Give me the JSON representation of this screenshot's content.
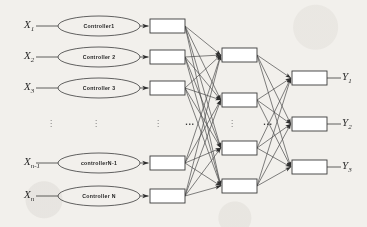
{
  "diagram": {
    "stroke_color": "#3b3b3b",
    "background_color": "#f2f0ec",
    "ellipsis_vertical": "vertical-ellipsis",
    "ellipsis_horizontal": "...",
    "inputs": [
      {
        "label": "X",
        "sub": "1",
        "controller": "Controller1",
        "y": 26
      },
      {
        "label": "X",
        "sub": "2",
        "controller": "Controller 2",
        "y": 57
      },
      {
        "label": "X",
        "sub": "3",
        "controller": "Controller 3",
        "y": 88
      },
      {
        "label": "X",
        "sub": "n-1",
        "controller": "controllerN-1",
        "y": 163
      },
      {
        "label": "X",
        "sub": "n",
        "controller": "Controller N",
        "y": 196
      }
    ],
    "input_boxes_y": [
      26,
      57,
      88,
      163,
      196
    ],
    "hidden_boxes_y": [
      55,
      100,
      148,
      186
    ],
    "output_boxes_y": [
      78,
      124,
      167
    ],
    "outputs": [
      {
        "label": "Y",
        "sub": "1",
        "y": 78
      },
      {
        "label": "Y",
        "sub": "2",
        "y": 124
      },
      {
        "label": "Y",
        "sub": "3",
        "y": 167
      }
    ],
    "vertical_dots": [
      {
        "x": 51,
        "y": 122
      },
      {
        "x": 96,
        "y": 122
      },
      {
        "x": 158,
        "y": 122
      },
      {
        "x": 232,
        "y": 122
      }
    ],
    "horizontal_dots": [
      {
        "x": 190,
        "y": 122
      },
      {
        "x": 268,
        "y": 122
      }
    ]
  }
}
